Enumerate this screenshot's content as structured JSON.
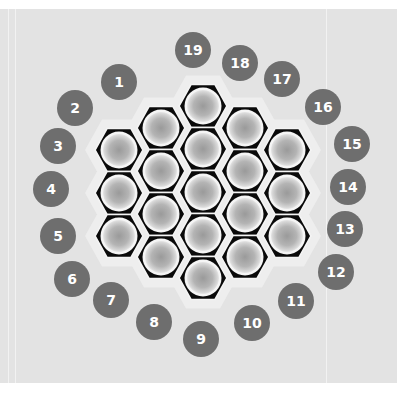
{
  "colors": {
    "background_panel": "#e3e3e3",
    "halo": "#eeeeee",
    "hex_border": "#0a0a0a",
    "cell_gradient_inner": "#9a9a9a",
    "cell_gradient_outer": "#d6d6d6",
    "cell_rim": "#f5f5f5",
    "label_circle": "#6e6e6e",
    "label_text": "#ffffff"
  },
  "grid": {
    "hex_half_width": 24,
    "hex_height": 43,
    "columns": [
      {
        "x": 119,
        "ys": [
          150,
          193,
          236
        ]
      },
      {
        "x": 161,
        "ys": [
          128,
          171,
          214,
          257
        ]
      },
      {
        "x": 203,
        "ys": [
          106,
          149,
          192,
          235,
          278
        ]
      },
      {
        "x": 245,
        "ys": [
          128,
          171,
          214,
          257
        ]
      },
      {
        "x": 287,
        "ys": [
          150,
          193,
          236
        ]
      }
    ]
  },
  "labels": [
    {
      "n": "1",
      "x": 119,
      "y": 82
    },
    {
      "n": "2",
      "x": 75,
      "y": 108
    },
    {
      "n": "3",
      "x": 58,
      "y": 146
    },
    {
      "n": "4",
      "x": 51,
      "y": 189
    },
    {
      "n": "5",
      "x": 58,
      "y": 236
    },
    {
      "n": "6",
      "x": 72,
      "y": 279
    },
    {
      "n": "7",
      "x": 111,
      "y": 300
    },
    {
      "n": "8",
      "x": 154,
      "y": 322
    },
    {
      "n": "9",
      "x": 201,
      "y": 339
    },
    {
      "n": "10",
      "x": 252,
      "y": 323
    },
    {
      "n": "11",
      "x": 296,
      "y": 301
    },
    {
      "n": "12",
      "x": 336,
      "y": 272
    },
    {
      "n": "13",
      "x": 345,
      "y": 229
    },
    {
      "n": "14",
      "x": 348,
      "y": 187
    },
    {
      "n": "15",
      "x": 352,
      "y": 144
    },
    {
      "n": "16",
      "x": 323,
      "y": 107
    },
    {
      "n": "17",
      "x": 282,
      "y": 79
    },
    {
      "n": "18",
      "x": 240,
      "y": 63
    },
    {
      "n": "19",
      "x": 193,
      "y": 50
    }
  ]
}
